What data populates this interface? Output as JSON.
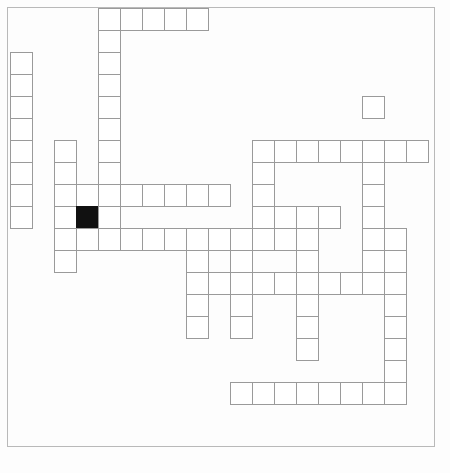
{
  "page": {
    "width": 450,
    "height": 473,
    "background_color": "#ffffff",
    "border_color": "#b9b9b9"
  },
  "grid": {
    "origin_x": 10,
    "origin_y": 8,
    "cell_size": 22,
    "columns": 19,
    "rows": 19,
    "cell_border_color": "#9a9a9a",
    "cell_fill_color": "#ffffff",
    "blocked_fill_color": "#111111",
    "blocked_cells": [
      [
        9,
        3
      ]
    ],
    "cells": [
      [
        0,
        4
      ],
      [
        0,
        5
      ],
      [
        0,
        6
      ],
      [
        0,
        7
      ],
      [
        0,
        8
      ],
      [
        1,
        4
      ],
      [
        2,
        0
      ],
      [
        2,
        4
      ],
      [
        3,
        0
      ],
      [
        3,
        4
      ],
      [
        4,
        0
      ],
      [
        4,
        4
      ],
      [
        4,
        16
      ],
      [
        5,
        0
      ],
      [
        5,
        4
      ],
      [
        6,
        0
      ],
      [
        6,
        2
      ],
      [
        6,
        4
      ],
      [
        6,
        11
      ],
      [
        6,
        12
      ],
      [
        6,
        13
      ],
      [
        6,
        14
      ],
      [
        6,
        15
      ],
      [
        6,
        16
      ],
      [
        6,
        17
      ],
      [
        6,
        18
      ],
      [
        7,
        0
      ],
      [
        7,
        2
      ],
      [
        7,
        4
      ],
      [
        7,
        11
      ],
      [
        7,
        16
      ],
      [
        8,
        0
      ],
      [
        8,
        2
      ],
      [
        8,
        3
      ],
      [
        8,
        4
      ],
      [
        8,
        5
      ],
      [
        8,
        6
      ],
      [
        8,
        7
      ],
      [
        8,
        8
      ],
      [
        8,
        9
      ],
      [
        8,
        11
      ],
      [
        8,
        16
      ],
      [
        9,
        0
      ],
      [
        9,
        2
      ],
      [
        9,
        3
      ],
      [
        9,
        4
      ],
      [
        9,
        11
      ],
      [
        9,
        12
      ],
      [
        9,
        13
      ],
      [
        9,
        14
      ],
      [
        9,
        16
      ],
      [
        10,
        2
      ],
      [
        10,
        3
      ],
      [
        10,
        4
      ],
      [
        10,
        5
      ],
      [
        10,
        6
      ],
      [
        10,
        7
      ],
      [
        10,
        8
      ],
      [
        10,
        9
      ],
      [
        10,
        10
      ],
      [
        10,
        11
      ],
      [
        10,
        12
      ],
      [
        10,
        13
      ],
      [
        10,
        16
      ],
      [
        10,
        17
      ],
      [
        11,
        2
      ],
      [
        11,
        8
      ],
      [
        11,
        10
      ],
      [
        11,
        13
      ],
      [
        11,
        16
      ],
      [
        11,
        17
      ],
      [
        12,
        8
      ],
      [
        12,
        9
      ],
      [
        12,
        10
      ],
      [
        12,
        11
      ],
      [
        12,
        12
      ],
      [
        12,
        13
      ],
      [
        12,
        14
      ],
      [
        12,
        15
      ],
      [
        12,
        16
      ],
      [
        12,
        17
      ],
      [
        13,
        8
      ],
      [
        13,
        10
      ],
      [
        13,
        13
      ],
      [
        13,
        17
      ],
      [
        14,
        8
      ],
      [
        14,
        10
      ],
      [
        14,
        13
      ],
      [
        14,
        17
      ],
      [
        15,
        13
      ],
      [
        15,
        17
      ],
      [
        16,
        17
      ],
      [
        17,
        10
      ],
      [
        17,
        11
      ],
      [
        17,
        12
      ],
      [
        17,
        13
      ],
      [
        17,
        14
      ],
      [
        17,
        15
      ],
      [
        17,
        16
      ],
      [
        17,
        17
      ]
    ]
  }
}
